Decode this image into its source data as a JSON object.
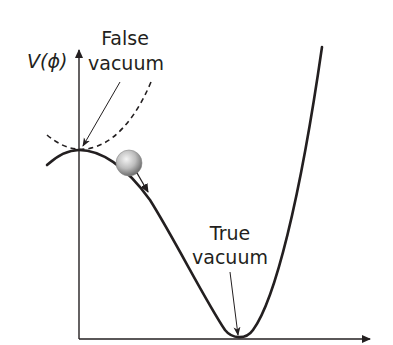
{
  "diagram": {
    "title": "",
    "axis": {
      "y_label_func": "V(",
      "y_label_var": "ϕ",
      "y_label_close": ")"
    },
    "labels": {
      "false_vacuum_line1": "False",
      "false_vacuum_line2": "vacuum",
      "true_vacuum_line1": "True",
      "true_vacuum_line2": "vacuum"
    },
    "elements": [
      {
        "name": "potential-curve",
        "style": "solid"
      },
      {
        "name": "false-vacuum-parabola",
        "style": "dashed"
      },
      {
        "name": "ball",
        "description": "gray sphere rolling down slope"
      },
      {
        "name": "roll-direction-arrow"
      }
    ],
    "colors": {
      "ink": "#231f20",
      "ball_light": "#f2f2f2",
      "ball_dark": "#6e6e6e"
    }
  }
}
